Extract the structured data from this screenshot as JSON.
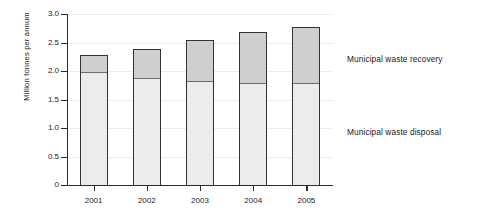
{
  "chart_data": {
    "type": "bar",
    "subtype": "stacked-vertical",
    "title": "",
    "xlabel": "",
    "ylabel": "Million tonnes per annum",
    "categories": [
      "2001",
      "2002",
      "2003",
      "2004",
      "2005"
    ],
    "ylim": [
      0,
      3.0
    ],
    "ytick_values": [
      0,
      0.5,
      1.0,
      1.5,
      2.0,
      2.5,
      3.0
    ],
    "ytick_labels": [
      "0",
      "0.5",
      "1.0",
      "1.5",
      "2.0",
      "2.5",
      "3.0"
    ],
    "grid": true,
    "grid_axis": "y",
    "legend_position": "right-inline-labels",
    "series": [
      {
        "name": "Municipal waste disposal",
        "color": "#ececec",
        "values": [
          2.0,
          1.9,
          1.84,
          1.81,
          1.81
        ]
      },
      {
        "name": "Municipal waste recovery",
        "color": "#cfcfcf",
        "values": [
          0.28,
          0.49,
          0.71,
          0.87,
          0.96
        ]
      }
    ],
    "totals": [
      2.28,
      2.39,
      2.55,
      2.68,
      2.77
    ],
    "units": "Million tonnes per annum"
  },
  "legend": {
    "recovery_label": "Municipal waste recovery",
    "disposal_label": "Municipal waste disposal"
  },
  "colors": {
    "recovery": "#cfcfcf",
    "disposal": "#ececec",
    "outline": "#333333",
    "axis": "#2b2b2b",
    "grid": "#ededed",
    "background": "#ffffff"
  }
}
